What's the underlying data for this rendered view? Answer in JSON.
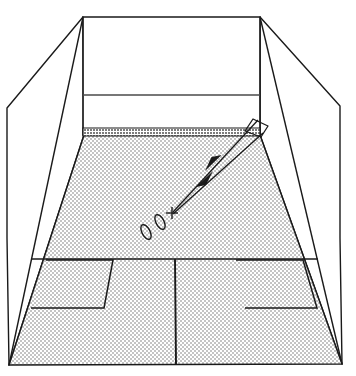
{
  "figure": {
    "background_color": "#ffffff",
    "line_color": "#1a1a1a",
    "floor_fill": "#e3e3e3",
    "tin_fill": "#c9c9c9",
    "wall_fill": "#ffffff"
  },
  "geometry": {
    "canvas": {
      "width": 356,
      "height": 376
    },
    "front_wall": {
      "name": "front-wall",
      "top_left": [
        83,
        17
      ],
      "top_right": [
        260,
        17
      ],
      "bottom_right": [
        260,
        135
      ],
      "bottom_left": [
        83,
        135
      ]
    },
    "service_line": {
      "name": "front-wall-service-line",
      "x1": 83,
      "y1": 95,
      "x2": 260,
      "y2": 95
    },
    "tin": {
      "name": "tin-board",
      "top_left": [
        83,
        128
      ],
      "top_right": [
        260,
        128
      ],
      "bottom_right": [
        260,
        136
      ],
      "bottom_left": [
        83,
        136
      ]
    },
    "left_wall": {
      "name": "left-side-wall",
      "points": [
        [
          83,
          17
        ],
        [
          7,
          108
        ],
        [
          7,
          238
        ],
        [
          9,
          365
        ],
        [
          84,
          135
        ]
      ]
    },
    "right_wall": {
      "name": "right-side-wall",
      "points": [
        [
          260,
          17
        ],
        [
          340,
          106
        ],
        [
          340,
          238
        ],
        [
          342,
          364
        ],
        [
          260,
          135
        ]
      ]
    },
    "left_wall_fold": {
      "name": "left-wall-fold-line",
      "x1": 83,
      "y1": 17,
      "x2": 9,
      "y2": 365
    },
    "right_wall_fold": {
      "name": "right-wall-fold-line",
      "x1": 260,
      "y1": 17,
      "x2": 342,
      "y2": 364
    },
    "floor": {
      "name": "court-floor",
      "points": [
        [
          84,
          135
        ],
        [
          260,
          135
        ],
        [
          342,
          364
        ],
        [
          9,
          365
        ]
      ]
    },
    "half_court_line": {
      "name": "half-court-line",
      "x1": 31,
      "y1": 259,
      "x2": 318,
      "y2": 259
    },
    "centre_line": {
      "name": "centre-line",
      "x1": 175,
      "y1": 259,
      "x2": 176,
      "y2": 365
    },
    "left_service_box": {
      "name": "left-service-box",
      "points": [
        [
          46,
          260
        ],
        [
          113,
          260
        ],
        [
          104,
          308
        ],
        [
          31,
          308
        ]
      ]
    },
    "right_service_box": {
      "name": "right-service-box",
      "points": [
        [
          236,
          260
        ],
        [
          303,
          260
        ],
        [
          317,
          308
        ],
        [
          245,
          308
        ]
      ]
    },
    "racket": {
      "name": "racket-outline",
      "points": [
        [
          253,
          119
        ],
        [
          268,
          126
        ],
        [
          261,
          137
        ],
        [
          245,
          131
        ]
      ]
    },
    "trajectory_outbound": {
      "name": "trajectory-outbound-arrow",
      "x1": 173,
      "y1": 212,
      "x2": 258,
      "y2": 120,
      "arrow_at": [
        214,
        162
      ],
      "arrow_direction": "toward-front-wall"
    },
    "trajectory_inbound": {
      "name": "trajectory-inbound-arrow",
      "x1": 263,
      "y1": 133,
      "x2": 173,
      "y2": 214,
      "arrow_at": [
        206,
        178
      ],
      "arrow_direction": "toward-player"
    },
    "impact_cross": {
      "name": "impact-point-cross",
      "cx": 172,
      "cy": 213,
      "size": 6
    },
    "ball_positions": [
      {
        "name": "ball-position-1",
        "cx": 160,
        "cy": 222,
        "rx": 4,
        "ry": 8,
        "rotation": -28
      },
      {
        "name": "ball-position-2",
        "cx": 146,
        "cy": 232,
        "rx": 4,
        "ry": 8,
        "rotation": -28
      }
    ]
  },
  "labels": {
    "front_wall": "Front wall",
    "tin": "Tin",
    "service_line": "Service line",
    "left_wall": "Left side wall",
    "right_wall": "Right side wall",
    "floor": "Court floor",
    "half_court_line": "Half-court line",
    "centre_line": "Centre line",
    "left_service_box": "Left service box",
    "right_service_box": "Right service box",
    "racket": "Racket",
    "ball_path": "Ball trajectory",
    "impact_point": "Impact point",
    "balls": "Ball positions"
  }
}
